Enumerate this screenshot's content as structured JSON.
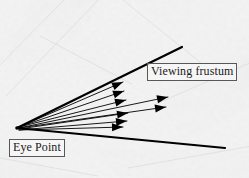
{
  "figure": {
    "name": "viewing-frustum-diagram",
    "width": 249,
    "height": 178,
    "background_color": "#f2f2f2",
    "ink_color": "#000000",
    "label_border_color": "#585858"
  },
  "labels": {
    "viewing_frustum": "Viewing frustum",
    "eye_point": "Eye Point"
  },
  "diagram_data": {
    "type": "diagram",
    "subject": "perspective viewing frustum with eye rays",
    "eye_point": {
      "x": 17,
      "y": 128
    },
    "frustum_edges": [
      {
        "name": "upper-frustum-edge",
        "x1": 17,
        "y1": 128,
        "x2": 182,
        "y2": 47,
        "width": 2.2
      },
      {
        "name": "lower-frustum-edge",
        "x1": 17,
        "y1": 128,
        "x2": 225,
        "y2": 148,
        "width": 2.2
      }
    ],
    "rays": [
      {
        "name": "ray-1",
        "x1": 19,
        "y1": 127,
        "x2": 123,
        "y2": 82,
        "width": 0.9
      },
      {
        "name": "ray-2",
        "x1": 19,
        "y1": 127,
        "x2": 124,
        "y2": 91,
        "width": 0.9
      },
      {
        "name": "ray-3",
        "x1": 19,
        "y1": 127,
        "x2": 126,
        "y2": 100,
        "width": 0.9
      },
      {
        "name": "ray-4",
        "x1": 19,
        "y1": 128,
        "x2": 168,
        "y2": 97,
        "width": 0.9
      },
      {
        "name": "ray-5",
        "x1": 19,
        "y1": 128,
        "x2": 166,
        "y2": 107,
        "width": 0.9
      },
      {
        "name": "ray-6",
        "x1": 19,
        "y1": 129,
        "x2": 128,
        "y2": 113,
        "width": 0.9
      },
      {
        "name": "ray-7",
        "x1": 19,
        "y1": 130,
        "x2": 127,
        "y2": 121,
        "width": 0.9
      },
      {
        "name": "ray-8",
        "x1": 19,
        "y1": 130,
        "x2": 123,
        "y2": 127,
        "width": 0.9
      }
    ],
    "arrowhead_style": {
      "shape": "solid-triangle",
      "length": 11,
      "half_width": 4
    }
  }
}
